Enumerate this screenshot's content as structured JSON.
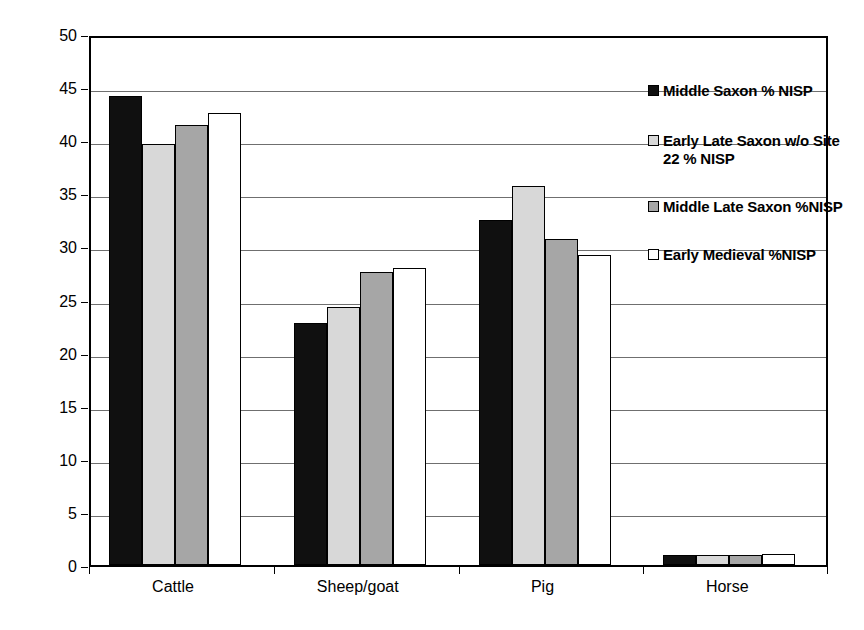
{
  "chart_data": {
    "type": "bar",
    "title": "",
    "xlabel": "",
    "ylabel": "% NISP",
    "ylim": [
      0,
      50
    ],
    "ytick_step": 5,
    "yticks": [
      "50",
      "45",
      "40",
      "35",
      "30",
      "25",
      "20",
      "15",
      "10",
      "5",
      "0"
    ],
    "grid": "horizontal",
    "legend_position": "right",
    "categories": [
      "Cattle",
      "Sheep/goat",
      "Pig",
      "Horse"
    ],
    "series": [
      {
        "name": "Middle Saxon % NISP",
        "swatch": "s0",
        "color": "#101010",
        "values": [
          44.2,
          22.8,
          32.5,
          0.9
        ]
      },
      {
        "name": "Early Late Saxon w/o Site 22 % NISP",
        "swatch": "s1",
        "color": "#d8d8d8",
        "values": [
          39.6,
          24.3,
          35.7,
          0.9
        ]
      },
      {
        "name": "Middle Late Saxon %NISP",
        "swatch": "s2",
        "color": "#a6a6a6",
        "values": [
          41.4,
          27.6,
          30.7,
          0.9
        ]
      },
      {
        "name": "Early Medieval %NISP",
        "swatch": "s3",
        "color": "#ffffff",
        "values": [
          42.6,
          28.0,
          29.2,
          1.0
        ]
      }
    ]
  }
}
